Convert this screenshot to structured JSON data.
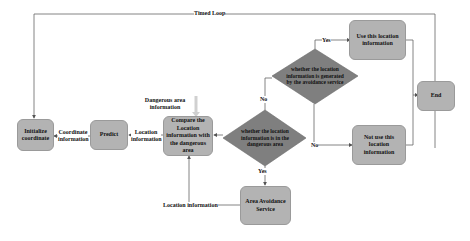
{
  "diagram": {
    "loop_label": "Timed Loop",
    "nodes": {
      "initialize": "Initialize coordinate",
      "predict": "Predict",
      "compare": "Compare the Location information with the dangerous area",
      "decision_dangerous": "whether the location information is in the dangerous area",
      "decision_generated": "whether the location information is generated by the avoidance service",
      "use_info": "Use this location information",
      "not_use_info": "Not use this location information",
      "end": "End",
      "avoidance_service": "Area Avoidance Service"
    },
    "edge_labels": {
      "coordinate_info": "Coordinate information",
      "location_info_1": "Location information",
      "dangerous_area_info": "Dangerous area information",
      "location_info_2": "Location information",
      "no_1": "No",
      "yes_1": "Yes",
      "no_2": "No",
      "yes_2": "Yes"
    },
    "colors": {
      "box_fill": "#b3b3b3",
      "diamond_fill": "#7f7f7f",
      "line": "#555555",
      "dangerous_arrow": "#d9d9d9"
    }
  }
}
